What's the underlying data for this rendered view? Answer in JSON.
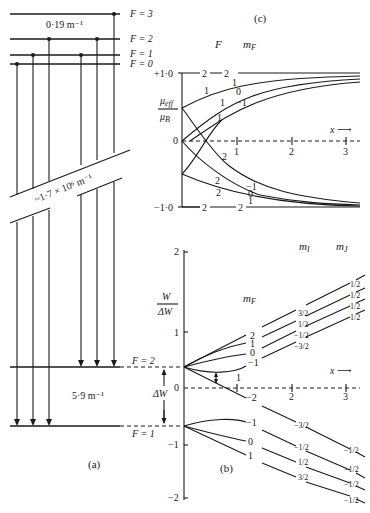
{
  "panel_a": {
    "label": "(a)",
    "upper_levels": [
      {
        "label": "F = 3"
      },
      {
        "label": "F = 2"
      },
      {
        "label": "F = 1"
      },
      {
        "label": "F = 0"
      }
    ],
    "upper_spacing": "0·19 m⁻¹",
    "gap_label": "~1·7 × 10⁶ m⁻¹",
    "lower_levels": [
      {
        "label": "F = 2"
      },
      {
        "label": "F = 1"
      }
    ],
    "lower_spacing": "5·9 m⁻¹",
    "delta_w_label": "ΔW"
  },
  "panel_c": {
    "label": "(c)",
    "col_F": "F",
    "col_mF": "m",
    "col_mF_sub": "F",
    "y_label_num": "μ",
    "y_label_num_sub": "eff",
    "y_label_den": "μ",
    "y_label_den_sub": "B",
    "y_ticks": [
      "+1·0",
      "0",
      "−1·0"
    ],
    "x_label": "x ⟶",
    "x_ticks": [
      "1",
      "2",
      "3"
    ],
    "top_labels": [
      {
        "F": "2",
        "mF": "2"
      },
      {
        "F": "1",
        "mF": "1"
      },
      {
        "F": "",
        "mF": "0"
      },
      {
        "F": "1",
        "mF": "−1"
      }
    ],
    "mid_labels": [
      "1",
      "1",
      "2"
    ],
    "bottom_labels": [
      {
        "F": "2",
        "mF": "−1"
      },
      {
        "F": "2",
        "mF": "0"
      },
      {
        "F": "2",
        "mF": "1"
      },
      {
        "F": "2",
        "mF": "2"
      }
    ]
  },
  "panel_b": {
    "label": "(b)",
    "y_label_num": "W",
    "y_label_den": "ΔW",
    "y_ticks": [
      "2",
      "1",
      "0",
      "−1",
      "−2"
    ],
    "x_label": "x ⟶",
    "x_ticks": [
      "1",
      "2",
      "3"
    ],
    "col_mF": "m",
    "col_mF_sub": "F",
    "col_mI": "m",
    "col_mI_sub": "I",
    "col_mJ": "m",
    "col_mJ_sub": "J",
    "upper_mF": [
      "2",
      "1",
      "0",
      "−1"
    ],
    "upper_cross_mF": "−2",
    "upper_mI": [
      "3/2",
      "1/2",
      "−1/2",
      "−3/2"
    ],
    "upper_mJ": [
      "1/2",
      "1/2",
      "1/2",
      "1/2"
    ],
    "lower_mF": [
      "−1",
      "0",
      "1"
    ],
    "lower_mI": [
      "−3/2",
      "−1/2",
      "1/2",
      "3/2"
    ],
    "lower_mJ": [
      "−1/2",
      "−1/2",
      "−1/2",
      "−1/2"
    ],
    "level_labels": [
      "2",
      "1"
    ],
    "delta_w_label": "ΔW"
  }
}
